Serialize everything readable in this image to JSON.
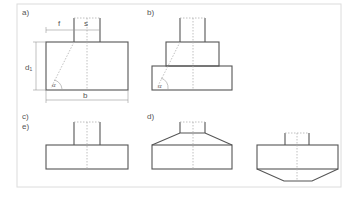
{
  "diagram": {
    "panels": [
      {
        "id": "a",
        "label": "a)",
        "description": "Rectangular foundation block under a column with load spread angle"
      },
      {
        "id": "b",
        "label": "b)",
        "description": "Stepped foundation with two steps"
      },
      {
        "id": "c",
        "label": "c)",
        "description": "Flat rectangular foundation"
      },
      {
        "id": "d",
        "label": "d)",
        "description": "Foundation with sloped (chamfered) top"
      },
      {
        "id": "e",
        "label": "e)",
        "description": "Foundation with tapered bottom"
      }
    ],
    "dimensions": {
      "f": "f",
      "s": "s",
      "b": "b",
      "d1": "d₁",
      "alpha": "α"
    }
  }
}
